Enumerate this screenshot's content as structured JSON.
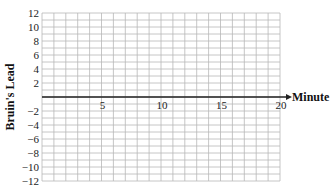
{
  "chart_data": {
    "type": "line",
    "title": "",
    "xlabel": "Minute",
    "ylabel": "Bruin's Lead",
    "xlim": [
      0,
      20
    ],
    "ylim": [
      -12,
      12
    ],
    "x_ticks": [
      5,
      10,
      15,
      20
    ],
    "x_tick_labels": [
      "5",
      "10",
      "15",
      "20"
    ],
    "y_ticks": [
      12,
      10,
      8,
      6,
      4,
      2,
      -2,
      -4,
      -6,
      -8,
      -10,
      -12
    ],
    "y_tick_labels": [
      "12",
      "10",
      "8",
      "6",
      "4",
      "2",
      "−2",
      "−4",
      "−6",
      "−8",
      "−10",
      "−12"
    ],
    "grid": true,
    "grid_x_step": 1,
    "grid_y_step": 1,
    "series": [],
    "x_axis_arrow": true
  },
  "colors": {
    "grid": "#b8b8b8",
    "axis": "#222222",
    "text": "#1a1a1a"
  }
}
